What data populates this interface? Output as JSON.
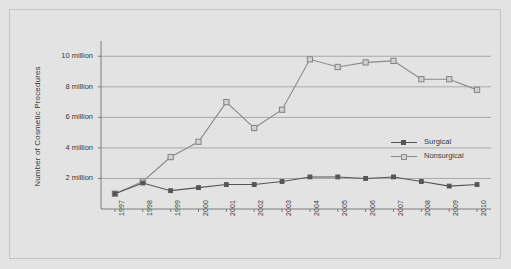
{
  "chart_data": {
    "type": "line",
    "title": "",
    "xlabel": "",
    "ylabel": "Number of Cosmetic Procedures",
    "categories": [
      "1997",
      "1998",
      "1999",
      "2000",
      "2001",
      "2002",
      "2003",
      "2004",
      "2005",
      "2006",
      "2007",
      "2008",
      "2009",
      "2010"
    ],
    "ylim": [
      0,
      11
    ],
    "y_ticks": [
      2,
      4,
      6,
      8,
      10
    ],
    "y_tick_labels": [
      "2 million",
      "4 million",
      "6 million",
      "8 million",
      "10 million"
    ],
    "grid": true,
    "legend_position": "right-middle",
    "series": [
      {
        "name": "Surgical",
        "marker": "filled-square",
        "color": "#555555",
        "values": [
          1.0,
          1.7,
          1.2,
          1.4,
          1.6,
          1.6,
          1.8,
          2.1,
          2.1,
          2.0,
          2.1,
          1.8,
          1.5,
          1.6
        ]
      },
      {
        "name": "Nonsurgical",
        "marker": "open-square",
        "color": "#8a8a8a",
        "values": [
          1.0,
          1.8,
          3.4,
          4.4,
          7.0,
          5.3,
          6.5,
          9.8,
          9.3,
          9.6,
          9.7,
          8.5,
          8.5,
          7.8
        ]
      }
    ]
  },
  "colors": {
    "background": "#e3e3e3",
    "frame_border": "#c4c4c4",
    "gridline": "#a9a9a9",
    "axis": "#7d7d7d",
    "surgical": "#555555",
    "nonsurgical": "#8a8a8a",
    "text": "#3a3a3a"
  }
}
